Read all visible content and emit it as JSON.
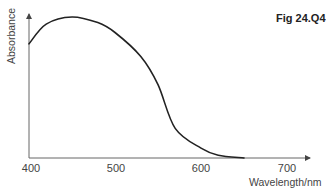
{
  "figure": {
    "label": "Fig 24.Q4"
  },
  "chart_data": {
    "type": "line",
    "title": "",
    "figure_label": "Fig 24.Q4",
    "xlabel": "Wavelength/nm",
    "ylabel": "Absorbance",
    "x_ticks": [
      400,
      500,
      600,
      700
    ],
    "x_tick_labels": [
      "400",
      "500",
      "600",
      "700"
    ],
    "xlim": [
      400,
      700
    ],
    "ylim": [
      0,
      1.05
    ],
    "y_ticks": [],
    "grid": false,
    "legend": null,
    "series": [
      {
        "name": "Absorbance spectrum",
        "color": "#222222",
        "x": [
          400,
          420,
          450,
          480,
          500,
          530,
          550,
          570,
          600,
          620,
          650
        ],
        "y": [
          0.81,
          0.95,
          1.0,
          0.96,
          0.89,
          0.72,
          0.52,
          0.21,
          0.07,
          0.02,
          0.0
        ]
      }
    ],
    "axes_style": {
      "color": "#666666",
      "arrows": true
    }
  }
}
